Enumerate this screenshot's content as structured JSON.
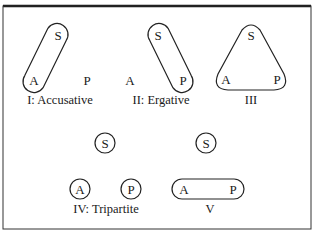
{
  "figure": {
    "panels": [
      {
        "id": "I",
        "caption": "I:  Accusative",
        "nodes": {
          "S": "S",
          "A": "A",
          "P": "P"
        },
        "grouping": "S and A enclosed together; P separate"
      },
      {
        "id": "II",
        "caption": "II:  Ergative",
        "nodes": {
          "S": "S",
          "A": "A",
          "P": "P"
        },
        "grouping": "S and P enclosed together; A separate"
      },
      {
        "id": "III",
        "caption": "III",
        "nodes": {
          "S": "S",
          "A": "A",
          "P": "P"
        },
        "grouping": "S, A and P all enclosed together"
      },
      {
        "id": "IV",
        "caption": "IV:  Tripartite",
        "nodes": {
          "S": "S",
          "A": "A",
          "P": "P"
        },
        "grouping": "S, A and P each enclosed separately"
      },
      {
        "id": "V",
        "caption": "V",
        "nodes": {
          "S": "S",
          "A": "A",
          "P": "P"
        },
        "grouping": "A and P enclosed together; S separate"
      }
    ],
    "colors": {
      "ink": "#1a1a1a",
      "background": "#ffffff"
    }
  }
}
